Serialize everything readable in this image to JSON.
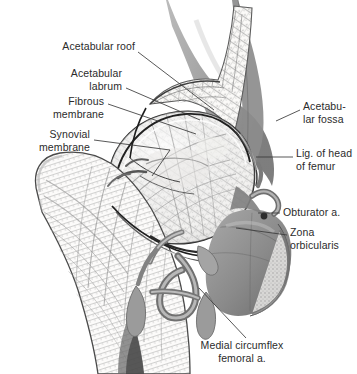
{
  "figure": {
    "width": 357,
    "height": 374,
    "background_color": "#ffffff",
    "label_color": "#2b2b2b",
    "leader_color": "#3a3a3a",
    "bone_outline_color": "#4a4a4a",
    "capsule_color": "#1a1a1a",
    "soft_tissue_grey": "#8e8e8e",
    "dark_grey": "#6d6d6d",
    "vessel_grey": "#9a9a9a",
    "trabecular_grey": "#b6b6b6"
  },
  "labels": [
    {
      "id": "acetabular-roof",
      "text": "Acetabular roof",
      "side": "left",
      "x": 135,
      "y": 45,
      "align": "right"
    },
    {
      "id": "acetabular-labrum",
      "text": "Acetabular\nlabrum",
      "side": "left",
      "x": 122,
      "y": 72,
      "align": "right"
    },
    {
      "id": "fibrous-membrane",
      "text": "Fibrous\nmembrane",
      "side": "left",
      "x": 104,
      "y": 100,
      "align": "right"
    },
    {
      "id": "synovial-membrane",
      "text": "Synovial\nmembrane",
      "side": "left",
      "x": 90,
      "y": 133,
      "align": "right"
    },
    {
      "id": "acetabular-fossa",
      "text": "Acetabu-\nlar fossa",
      "side": "right",
      "x": 303,
      "y": 105,
      "align": "left"
    },
    {
      "id": "lig-head-of-femur",
      "text": "Lig. of head\nof femur",
      "side": "right",
      "x": 296,
      "y": 152,
      "align": "left"
    },
    {
      "id": "obturator-artery",
      "text": "Obturator a.",
      "side": "right",
      "x": 283,
      "y": 209,
      "align": "left"
    },
    {
      "id": "zona-orbicularis",
      "text": "Zona\norbicularis",
      "side": "right",
      "x": 290,
      "y": 229,
      "align": "left"
    },
    {
      "id": "medial-circumflex",
      "text": "Medial circumflex\nfemoral a.",
      "side": "bottom",
      "x": 242,
      "y": 345,
      "align": "center"
    }
  ],
  "leaders": [
    {
      "id": "leader-acetabular-roof",
      "points": "138,52 214,110"
    },
    {
      "id": "leader-acetabular-labrum",
      "points": "126,88 200,120"
    },
    {
      "id": "leader-fibrous-membrane",
      "points": "108,104 196,134"
    },
    {
      "id": "leader-synovial-membrane-a",
      "points": "94,140 170,150"
    },
    {
      "id": "leader-synovial-membrane-b",
      "points": "170,150 152,174"
    },
    {
      "id": "leader-acetabular-fossa",
      "points": "300,110 276,121"
    },
    {
      "id": "leader-lig-head-of-femur",
      "points": "293,157 256,157"
    },
    {
      "id": "leader-obturator-artery",
      "points": "280,213 258,213"
    },
    {
      "id": "leader-zona-orbicularis",
      "points": "287,235 236,228"
    },
    {
      "id": "leader-medial-circumflex",
      "points": "246,338 199,288"
    }
  ],
  "structures": [
    {
      "id": "ilium-body",
      "name": "ilium-body",
      "kind": "soft-tissue-grey"
    },
    {
      "id": "acetabular-rim",
      "name": "acetabular-rim",
      "kind": "cut-bone"
    },
    {
      "id": "femoral-head",
      "name": "femoral-head",
      "kind": "cut-bone"
    },
    {
      "id": "femoral-neck",
      "name": "femoral-neck",
      "kind": "cut-bone"
    },
    {
      "id": "greater-trochanter",
      "name": "greater-trochanter",
      "kind": "cut-bone"
    },
    {
      "id": "femoral-shaft",
      "name": "femoral-shaft",
      "kind": "cut-bone"
    },
    {
      "id": "ischium-pubis",
      "name": "ischium-pubis-wedge",
      "kind": "soft-tissue-grey"
    },
    {
      "id": "joint-capsule",
      "name": "joint-capsule-outline",
      "kind": "capsule-line"
    },
    {
      "id": "lig-teres",
      "name": "ligament-of-head",
      "kind": "ligament"
    },
    {
      "id": "obturator-vessel",
      "name": "obturator-artery-vessel",
      "kind": "vessel"
    },
    {
      "id": "circumflex-vessel",
      "name": "circumflex-artery-vessel",
      "kind": "vessel"
    }
  ]
}
